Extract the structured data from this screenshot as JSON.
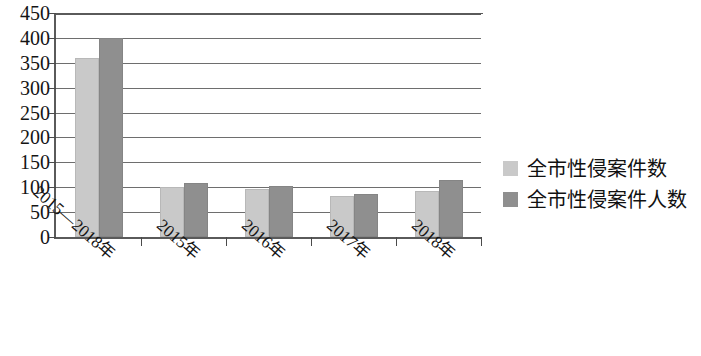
{
  "chart_data": {
    "type": "bar",
    "title": "",
    "subtitle": "",
    "xlabel": "",
    "ylabel": "",
    "ylim": [
      0,
      450
    ],
    "ytick_step": 50,
    "yticks": [
      "450",
      "400",
      "350",
      "300",
      "250",
      "200",
      "150",
      "100",
      "50",
      "0"
    ],
    "grid": true,
    "legend_position": "right",
    "categories": [
      "2015—2018年",
      "2015年",
      "2016年",
      "2017年",
      "2018年"
    ],
    "series": [
      {
        "name": "全市性侵案件数",
        "color": "#c9c9c9",
        "values": [
          360,
          101,
          97,
          82,
          92
        ]
      },
      {
        "name": "全市性侵案件人数",
        "color": "#8f8f8f",
        "values": [
          400,
          108,
          103,
          87,
          115
        ]
      }
    ]
  },
  "legend": {
    "items": [
      {
        "label": "全市性侵案件数",
        "color": "#c9c9c9",
        "swatch": "legend-swatch-light"
      },
      {
        "label": "全市性侵案件人数",
        "color": "#8f8f8f",
        "swatch": "legend-swatch-dark"
      }
    ]
  },
  "axes": {
    "y_max": 450,
    "y_min": 0,
    "y_step": 50
  }
}
